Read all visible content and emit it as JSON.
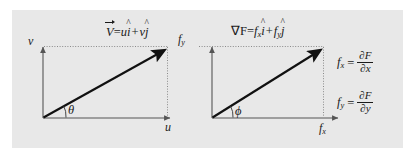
{
  "figure": {
    "name": "vector-components-diagram",
    "background_color": "#ffffff",
    "panel_color": "#e8e8e8"
  },
  "left_diagram": {
    "name": "velocity-vector-diagram",
    "equation": {
      "vector_symbol": "V",
      "equals": "=",
      "term_x_coef": "u",
      "term_x_unit": "i",
      "plus": "+",
      "term_y_coef": "v",
      "term_y_unit": "j"
    },
    "y_axis_label": "v",
    "x_axis_label": "u",
    "angle_label": "θ"
  },
  "right_diagram": {
    "name": "gradient-vector-diagram",
    "equation": {
      "vector_symbol": "∇F",
      "equals": "=",
      "term_x_coef": "f",
      "term_x_sub": "x",
      "term_x_unit": "i",
      "plus": "+",
      "term_y_coef": "f",
      "term_y_sub": "y",
      "term_y_unit": "j"
    },
    "y_axis_label_base": "f",
    "y_axis_label_sub": "y",
    "x_axis_label_base": "f",
    "x_axis_label_sub": "x",
    "angle_label": "ϕ",
    "definitions": [
      {
        "lhs_base": "f",
        "lhs_sub": "x",
        "equals": "=",
        "numerator": "∂F",
        "denominator": "∂x"
      },
      {
        "lhs_base": "f",
        "lhs_sub": "y",
        "equals": "=",
        "numerator": "∂F",
        "denominator": "∂y"
      }
    ]
  }
}
